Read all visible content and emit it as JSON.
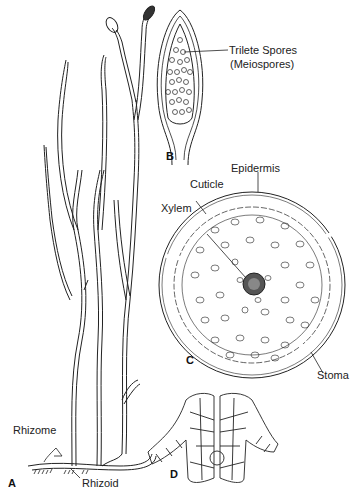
{
  "figure": {
    "panels": [
      {
        "id": "A",
        "letter": "A",
        "description": "Whole plant with upright dichotomously branching axes"
      },
      {
        "id": "B",
        "letter": "B",
        "description": "Sporangium longitudinal section"
      },
      {
        "id": "C",
        "letter": "C",
        "description": "Stem cross section"
      },
      {
        "id": "D",
        "letter": "D",
        "description": "Stoma detail"
      }
    ],
    "labels": {
      "trilete_spores": "Trilete Spores",
      "meiospores": "(Meiospores)",
      "epidermis": "Epidermis",
      "cuticle": "Cuticle",
      "xylem": "Xylem",
      "stoma": "Stoma",
      "rhizome": "Rhizome",
      "rhizoid": "Rhizoid"
    },
    "line_color": "#222222",
    "background": "#ffffff"
  }
}
